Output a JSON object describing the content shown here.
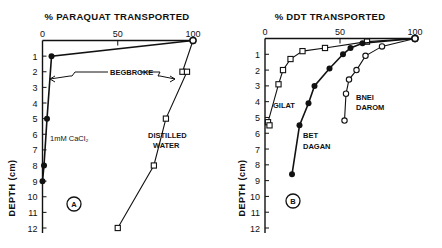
{
  "chart_data": [
    {
      "type": "line",
      "panel": "A",
      "title": "% PARAQUAT TRANSPORTED",
      "xlabel": "% PARAQUAT TRANSPORTED",
      "ylabel": "DEPTH (cm)",
      "xlim": [
        0,
        100
      ],
      "ylim": [
        0,
        12
      ],
      "y_inverted": true,
      "x_ticks": [
        "0",
        "50",
        "100"
      ],
      "y_ticks": [
        "1",
        "2",
        "3",
        "4",
        "5",
        "6",
        "7",
        "8",
        "9",
        "10",
        "11",
        "12"
      ],
      "grid": false,
      "annotations": [
        "BEGBROKE"
      ],
      "series": [
        {
          "name": "Distilled Water",
          "label": "DISTILLED WATER",
          "marker": "open-square",
          "points": [
            [
              100,
              0
            ],
            [
              93,
              2
            ],
            [
              96,
              2
            ],
            [
              82,
              5
            ],
            [
              74,
              8
            ],
            [
              50,
              12
            ]
          ]
        },
        {
          "name": "1 mM CaCl2",
          "label": "1mM CaCl₂",
          "marker": "filled-circle",
          "points": [
            [
              100,
              0
            ],
            [
              6,
              1
            ],
            [
              3,
              5
            ],
            [
              1,
              8
            ],
            [
              0,
              9
            ]
          ]
        }
      ]
    },
    {
      "type": "line",
      "panel": "B",
      "title": "% DDT TRANSPORTED",
      "xlabel": "% DDT TRANSPORTED",
      "ylabel": "DEPTH (cm)",
      "xlim": [
        0,
        100
      ],
      "ylim": [
        0,
        12
      ],
      "y_inverted": true,
      "x_ticks": [
        "0",
        "50",
        "100"
      ],
      "y_ticks": [
        "1",
        "2",
        "3",
        "4",
        "5",
        "6",
        "7",
        "8",
        "9",
        "10",
        "11",
        "12"
      ],
      "grid": false,
      "series": [
        {
          "name": "Gilat",
          "label": "GILAT",
          "marker": "open-square",
          "points": [
            [
              100,
              0
            ],
            [
              68,
              0.2
            ],
            [
              40,
              0.6
            ],
            [
              25,
              0.8
            ],
            [
              17,
              1.3
            ],
            [
              12,
              2.0
            ],
            [
              9,
              2.9
            ],
            [
              2,
              5.3
            ],
            [
              3,
              5.5
            ]
          ]
        },
        {
          "name": "Bet Dagan",
          "label": "BET DAGAN",
          "marker": "filled-circle",
          "points": [
            [
              100,
              0
            ],
            [
              65,
              0.3
            ],
            [
              57,
              0.6
            ],
            [
              52,
              1.0
            ],
            [
              43,
              1.9
            ],
            [
              33,
              3.0
            ],
            [
              29,
              4.1
            ],
            [
              23,
              5.5
            ],
            [
              18,
              8.6
            ]
          ]
        },
        {
          "name": "Bnei Darom",
          "label": "BNEI DAROM",
          "marker": "open-circle",
          "points": [
            [
              100,
              0
            ],
            [
              78,
              0.5
            ],
            [
              67,
              1.1
            ],
            [
              61,
              2.0
            ],
            [
              56,
              2.6
            ],
            [
              54,
              3.5
            ],
            [
              53,
              5.2
            ]
          ]
        }
      ]
    }
  ],
  "panels": {
    "a": {
      "title": "% PARAQUAT TRANSPORTED",
      "badge": "A",
      "ylabel": "DEPTH (cm)",
      "annotation": "BEGBROKE",
      "label_water_1": "DISTILLED",
      "label_water_2": "WATER",
      "label_cacl": "1mM CaCl₂"
    },
    "b": {
      "title": "% DDT TRANSPORTED",
      "badge": "B",
      "ylabel": "DEPTH (cm)",
      "label_gilat": "GILAT",
      "label_bet_1": "BET",
      "label_bet_2": "DAGAN",
      "label_bnei_1": "BNEI",
      "label_bnei_2": "DAROM"
    }
  }
}
